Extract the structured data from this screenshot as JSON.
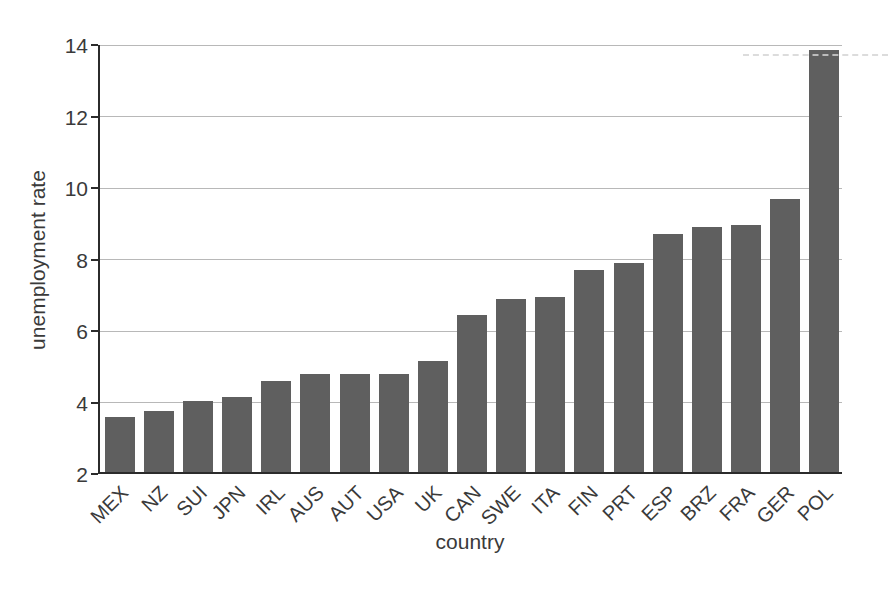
{
  "chart_data": {
    "type": "bar",
    "title": "",
    "xlabel": "country",
    "ylabel": "unemployment rate",
    "categories": [
      "MEX",
      "NZ",
      "SUI",
      "JPN",
      "IRL",
      "AUS",
      "AUT",
      "USA",
      "UK",
      "CAN",
      "SWE",
      "ITA",
      "FIN",
      "PRT",
      "ESP",
      "BRZ",
      "FRA",
      "GER",
      "POL"
    ],
    "values": [
      3.55,
      3.7,
      4.0,
      4.1,
      4.55,
      4.75,
      4.75,
      4.75,
      5.1,
      6.4,
      6.85,
      6.9,
      7.65,
      7.85,
      8.65,
      8.85,
      8.9,
      9.65,
      13.8
    ],
    "ylim": [
      2,
      14
    ],
    "yticks": [
      2,
      4,
      6,
      8,
      10,
      12,
      14
    ],
    "grid": "horizontal",
    "legend": "none",
    "bar_color": "#5f5f5f",
    "grid_color": "#b8b8b8",
    "axis_color": "#2b2b2b",
    "text_color": "#3a3a3a"
  }
}
